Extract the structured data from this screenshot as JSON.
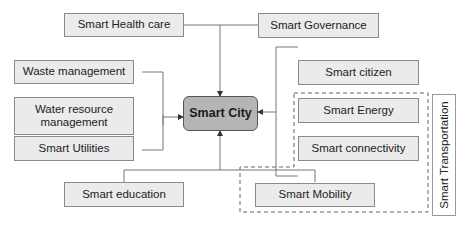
{
  "diagram": {
    "center": "Smart City",
    "nodes": {
      "health": "Smart Health care",
      "governance": "Smart Governance",
      "waste": "Waste management",
      "water": "Water resource management",
      "utilities": "Smart Utilities",
      "education": "Smart education",
      "citizen": "Smart citizen",
      "energy": "Smart Energy",
      "connectivity": "Smart connectivity",
      "mobility": "Smart Mobility"
    },
    "group_label": "Smart Transportation"
  }
}
